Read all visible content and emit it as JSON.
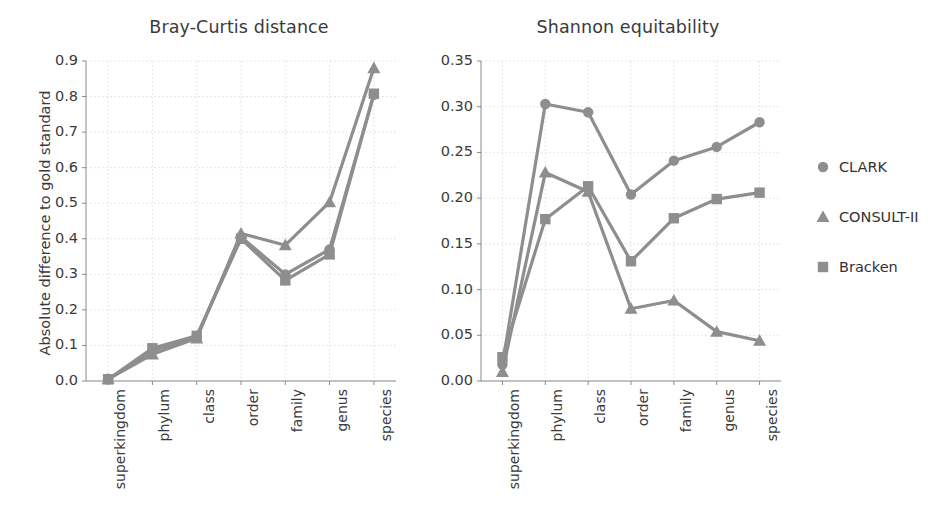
{
  "figure": {
    "legend": {
      "position": "right",
      "entries": [
        {
          "label": "CLARK",
          "marker": "circle",
          "color": "#8e8e8e"
        },
        {
          "label": "CONSULT-II",
          "marker": "triangle",
          "color": "#8e8e8e"
        },
        {
          "label": "Bracken",
          "marker": "square",
          "color": "#8e8e8e"
        }
      ]
    }
  },
  "chart_data": [
    {
      "type": "line",
      "title": "Bray-Curtis distance",
      "xlabel": "",
      "ylabel": "Absolute difference to gold standard",
      "categories": [
        "superkingdom",
        "phylum",
        "class",
        "order",
        "family",
        "genus",
        "species"
      ],
      "ylim": [
        0.0,
        0.9
      ],
      "yticks": [
        "0.0",
        "0.1",
        "0.2",
        "0.3",
        "0.4",
        "0.5",
        "0.6",
        "0.7",
        "0.8",
        "0.9"
      ],
      "ytick_values": [
        0.0,
        0.1,
        0.2,
        0.3,
        0.4,
        0.5,
        0.6,
        0.7,
        0.8,
        0.9
      ],
      "grid": true,
      "legend_position": "right",
      "series": [
        {
          "name": "CLARK",
          "marker": "circle",
          "color": "#8e8e8e",
          "values": [
            0.005,
            0.085,
            0.125,
            0.405,
            0.3,
            0.37,
            0.805
          ]
        },
        {
          "name": "CONSULT-II",
          "marker": "triangle",
          "color": "#8e8e8e",
          "values": [
            0.005,
            0.075,
            0.12,
            0.415,
            0.382,
            0.503,
            0.88
          ]
        },
        {
          "name": "Bracken",
          "marker": "square",
          "color": "#8e8e8e",
          "values": [
            0.005,
            0.092,
            0.127,
            0.4,
            0.283,
            0.356,
            0.808
          ]
        }
      ]
    },
    {
      "type": "line",
      "title": "Shannon equitability",
      "xlabel": "",
      "ylabel": "",
      "categories": [
        "superkingdom",
        "phylum",
        "class",
        "order",
        "family",
        "genus",
        "species"
      ],
      "ylim": [
        0.0,
        0.35
      ],
      "yticks": [
        "0.00",
        "0.05",
        "0.10",
        "0.15",
        "0.20",
        "0.25",
        "0.30",
        "0.35"
      ],
      "ytick_values": [
        0.0,
        0.05,
        0.1,
        0.15,
        0.2,
        0.25,
        0.3,
        0.35
      ],
      "grid": true,
      "legend_position": "right",
      "series": [
        {
          "name": "CLARK",
          "marker": "circle",
          "color": "#8e8e8e",
          "values": [
            0.018,
            0.303,
            0.294,
            0.204,
            0.241,
            0.256,
            0.283
          ]
        },
        {
          "name": "CONSULT-II",
          "marker": "triangle",
          "color": "#8e8e8e",
          "values": [
            0.01,
            0.228,
            0.207,
            0.079,
            0.088,
            0.054,
            0.044
          ]
        },
        {
          "name": "Bracken",
          "marker": "square",
          "color": "#8e8e8e",
          "values": [
            0.026,
            0.177,
            0.213,
            0.131,
            0.178,
            0.199,
            0.206
          ]
        }
      ]
    }
  ]
}
